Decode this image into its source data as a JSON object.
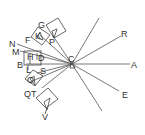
{
  "diagram": {
    "center": {
      "label": "C",
      "x": 72,
      "y": 63
    },
    "rays": [
      {
        "name": "ray-a",
        "x2": 128,
        "y2": 64
      },
      {
        "name": "ray-r",
        "x2": 120,
        "y2": 37
      },
      {
        "name": "ray-e",
        "x2": 118,
        "y2": 90
      },
      {
        "name": "ray-upper",
        "x2": 99,
        "y2": 18
      },
      {
        "name": "ray-lower",
        "x2": 102,
        "y2": 111
      },
      {
        "name": "ray-p",
        "x2": 52,
        "y2": 35
      },
      {
        "name": "ray-k",
        "x2": 36,
        "y2": 34
      },
      {
        "name": "ray-n",
        "x2": 17,
        "y2": 43
      },
      {
        "name": "ray-m",
        "x2": 20,
        "y2": 51
      },
      {
        "name": "ray-s",
        "x2": 38,
        "y2": 72
      },
      {
        "name": "ray-o",
        "x2": 30,
        "y2": 80
      },
      {
        "name": "ray-t",
        "x2": 40,
        "y2": 88
      }
    ],
    "labels": {
      "A": "A",
      "R": "R",
      "E": "E",
      "C": "C",
      "G": "G",
      "P": "P",
      "F": "F",
      "K": "K",
      "N": "N",
      "M": "M",
      "H": "H",
      "D": "D",
      "B": "B",
      "L": "L",
      "S": "S",
      "O": "O",
      "Q": "Q",
      "T": "T",
      "V": "V"
    },
    "stroke_color": "#555555",
    "background": "#ffffff"
  }
}
